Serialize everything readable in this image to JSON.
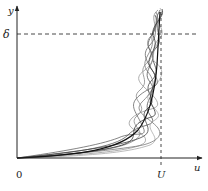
{
  "diagram": {
    "axes": {
      "y_label": "y",
      "x_label": "u",
      "origin_label": "0"
    },
    "markers": {
      "delta_label": "δ",
      "U_label": "U"
    },
    "colors": {
      "axis": "#222222",
      "mean_profile": "#111111",
      "instantaneous": "#777777",
      "dashed": "#333333"
    }
  }
}
